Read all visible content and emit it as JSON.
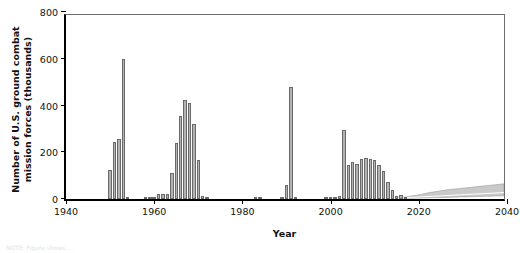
{
  "chart_data": {
    "type": "bar",
    "title": "",
    "xlabel": "Year",
    "ylabel": "Number of U.S. ground combat\nmission forces (thousands)",
    "xlim": [
      1940,
      2040
    ],
    "ylim": [
      0,
      800
    ],
    "xticks": [
      1940,
      1960,
      1980,
      2000,
      2020,
      2040
    ],
    "yticks": [
      0,
      200,
      400,
      600,
      800
    ],
    "grid": false,
    "legend": null,
    "bar_color": "#b3b3b3",
    "bar_edge_color": "#6a6a6a",
    "axis_color": "#000000",
    "band_color": "#c9c9c9",
    "series_name": "U.S. ground combat mission forces",
    "x": [
      1950,
      1951,
      1952,
      1953,
      1954,
      1958,
      1959,
      1960,
      1961,
      1962,
      1963,
      1964,
      1965,
      1966,
      1967,
      1968,
      1969,
      1970,
      1971,
      1972,
      1983,
      1984,
      1989,
      1990,
      1991,
      1992,
      1999,
      2000,
      2001,
      2002,
      2003,
      2004,
      2005,
      2006,
      2007,
      2008,
      2009,
      2010,
      2011,
      2012,
      2013,
      2014,
      2015,
      2016,
      2017
    ],
    "values": [
      125,
      245,
      255,
      600,
      10,
      5,
      3,
      4,
      20,
      22,
      20,
      110,
      240,
      355,
      425,
      410,
      320,
      165,
      15,
      5,
      8,
      3,
      4,
      60,
      480,
      8,
      4,
      3,
      10,
      12,
      295,
      145,
      160,
      150,
      172,
      175,
      170,
      168,
      145,
      120,
      72,
      40,
      12,
      18,
      6
    ],
    "projection": {
      "label": "projection band",
      "start_year": 2016,
      "end_year": 2040,
      "upper": [
        6,
        8,
        10,
        13,
        16,
        20,
        24,
        28,
        31,
        34,
        37,
        40,
        42,
        44,
        46,
        48,
        50,
        52,
        54,
        56,
        58,
        60,
        62,
        64,
        66
      ],
      "mid": [
        4,
        5,
        6,
        7,
        8,
        9,
        10,
        11,
        12,
        13,
        14,
        15,
        16,
        17,
        18,
        19,
        20,
        21,
        22,
        23,
        24,
        25,
        26,
        27,
        28
      ],
      "lower": [
        2,
        2,
        3,
        3,
        4,
        4,
        5,
        5,
        6,
        6,
        7,
        7,
        8,
        8,
        9,
        9,
        10,
        10,
        11,
        11,
        12,
        12,
        13,
        13,
        14
      ]
    }
  },
  "footnote": {
    "text": "NOTE: Figure shows ..."
  }
}
